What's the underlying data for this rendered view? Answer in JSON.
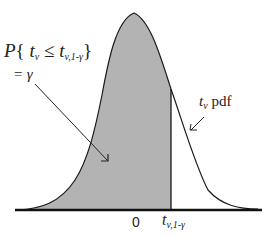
{
  "diagram": {
    "type": "t-distribution pdf with shaded lower tail",
    "colors": {
      "shade": "#b3b3b3",
      "line": "#1a1a1a",
      "background": "#ffffff"
    },
    "annotations": {
      "probability_label": {
        "P": "P",
        "open": "{",
        "t": "t",
        "t_sub": "v",
        "leq": "≤",
        "t2": "t",
        "t2_sub": "v,1-γ",
        "close": "}"
      },
      "equals_label": "= γ",
      "pdf_label": {
        "t": "t",
        "t_sub": "v",
        "text": "pdf"
      }
    },
    "axis": {
      "zero_label": "0",
      "critical_label": {
        "t": "t",
        "sub": "v,1-γ"
      }
    }
  }
}
